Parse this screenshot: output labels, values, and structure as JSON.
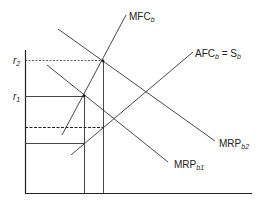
{
  "diagram": {
    "type": "economics-factor-market",
    "axis_labels": {
      "r2": {
        "base": "r",
        "sub": "2"
      },
      "r1": {
        "base": "r",
        "sub": "1"
      }
    },
    "curves": {
      "mfc": {
        "base": "MFC",
        "sub": "b"
      },
      "afc": {
        "base": "AFC",
        "sub": "b",
        "eq": " = S",
        "sub2": "b"
      },
      "mrp2": {
        "base": "MRP",
        "sub": "b2"
      },
      "mrp1": {
        "base": "MRP",
        "sub": "b1"
      }
    },
    "colors": {
      "line": "#222222",
      "background": "#ffffff"
    }
  }
}
